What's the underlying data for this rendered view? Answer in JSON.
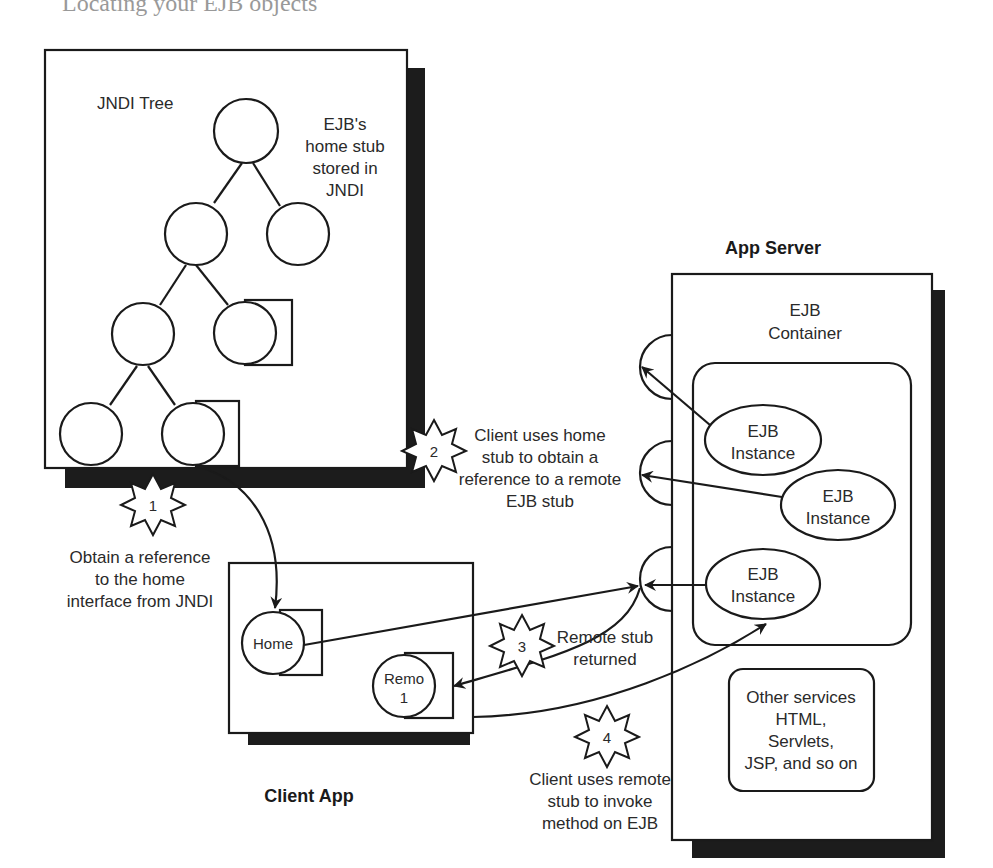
{
  "header_fragment": "Locating your EJB objects",
  "jndi_box": {
    "title": "JNDI Tree",
    "note_lines": [
      "EJB's",
      "home stub",
      "stored in",
      "JNDI"
    ]
  },
  "client_app": {
    "title": "Client App",
    "home_stub_label": "Home",
    "remote_stub_label_lines": [
      "Remo",
      "1"
    ]
  },
  "app_server": {
    "title": "App Server",
    "container_label_lines": [
      "EJB",
      "Container"
    ],
    "instances": [
      {
        "label_lines": [
          "EJB",
          "Instance"
        ]
      },
      {
        "label_lines": [
          "EJB",
          "Instance"
        ]
      },
      {
        "label_lines": [
          "EJB",
          "Instance"
        ]
      }
    ],
    "other_services_lines": [
      "Other services",
      "HTML,",
      "Servlets,",
      "JSP, and so on"
    ]
  },
  "steps": [
    {
      "number": "1",
      "lines": [
        "Obtain a reference",
        "to the home",
        "interface from JNDI"
      ]
    },
    {
      "number": "2",
      "lines": [
        "Client uses home",
        "stub to obtain a",
        "reference to a remote",
        "EJB stub"
      ]
    },
    {
      "number": "3",
      "lines": [
        "Remote stub",
        "returned"
      ]
    },
    {
      "number": "4",
      "lines": [
        "Client uses remote",
        "stub to invoke",
        "method on EJB"
      ]
    }
  ]
}
